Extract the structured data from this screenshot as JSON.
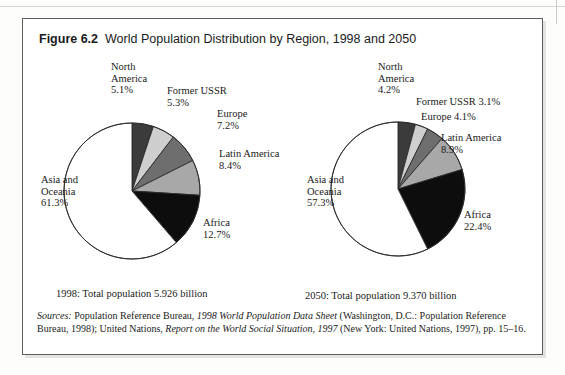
{
  "figure": {
    "number": "Figure 6.2",
    "title": "World Population Distribution by Region, 1998 and 2050"
  },
  "colors": {
    "north_america": "#3b3b3b",
    "former_ussr": "#cfcfcf",
    "europe": "#6e6e6e",
    "latin_america": "#a8a8a8",
    "africa": "#0d0d0d",
    "asia_oceania": "#ffffff",
    "outline": "#2b2b2b",
    "frame": "#5d5d5d",
    "text": "#1a1a1a"
  },
  "chart_data": [
    {
      "type": "pie",
      "title": "1998",
      "caption": "1998: Total population 5.926 billion",
      "total_population": "5.926 billion",
      "start_angle_deg": 0,
      "direction": "clockwise",
      "categories": [
        "North America",
        "Former USSR",
        "Europe",
        "Latin America",
        "Africa",
        "Asia and Oceania"
      ],
      "values": [
        5.1,
        5.3,
        7.2,
        8.4,
        12.7,
        61.3
      ],
      "unit": "percent",
      "labels": [
        {
          "name": "North America",
          "text": "North\nAmerica\n5.1%",
          "value": 5.1
        },
        {
          "name": "Former USSR",
          "text": "Former USSR\n5.3%",
          "value": 5.3
        },
        {
          "name": "Europe",
          "text": "Europe\n7.2%",
          "value": 7.2
        },
        {
          "name": "Latin America",
          "text": "Latin America\n8.4%",
          "value": 8.4
        },
        {
          "name": "Africa",
          "text": "Africa\n12.7%",
          "value": 12.7
        },
        {
          "name": "Asia and Oceania",
          "text": "Asia and\nOceania\n61.3%",
          "value": 61.3
        }
      ]
    },
    {
      "type": "pie",
      "title": "2050",
      "caption": "2050: Total population 9.370 billion",
      "total_population": "9.370 billion",
      "start_angle_deg": 0,
      "direction": "clockwise",
      "categories": [
        "North America",
        "Former USSR",
        "Europe",
        "Latin America",
        "Africa",
        "Asia and Oceania"
      ],
      "values": [
        4.2,
        3.1,
        4.1,
        8.9,
        22.4,
        57.3
      ],
      "unit": "percent",
      "labels": [
        {
          "name": "North America",
          "text": "North\nAmerica\n4.2%",
          "value": 4.2
        },
        {
          "name": "Former USSR",
          "text": "Former USSR 3.1%",
          "value": 3.1
        },
        {
          "name": "Europe",
          "text": "Europe 4.1%",
          "value": 4.1
        },
        {
          "name": "Latin America",
          "text": "Latin America\n8.9%",
          "value": 8.9
        },
        {
          "name": "Africa",
          "text": "Africa\n22.4%",
          "value": 22.4
        },
        {
          "name": "Asia and Oceania",
          "text": "Asia and\nOceania\n57.3%",
          "value": 57.3
        }
      ]
    }
  ],
  "source": {
    "prefix": "Sources:",
    "part1": " Population Reference Bureau, ",
    "italic1": "1998 World Population Data Sheet",
    "part2": " (Washington, D.C.: Population Reference Bureau, 1998); United Nations, ",
    "italic2": "Report on the World Social Situation, 1997",
    "part3": " (New York: United Nations, 1997), pp. 15–16."
  }
}
